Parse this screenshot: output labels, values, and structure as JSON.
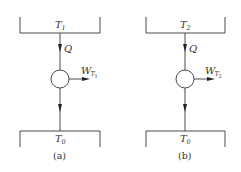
{
  "diagrams": [
    {
      "id": "a",
      "caption": "(a)",
      "hot_reservoir": {
        "symbol": "T",
        "subscript": "1"
      },
      "heat_flow": {
        "label": "Q"
      },
      "work_output": {
        "symbol": "W",
        "subscript": "T",
        "subsubscript": "1"
      },
      "cold_reservoir": {
        "symbol": "T",
        "subscript": "0"
      }
    },
    {
      "id": "b",
      "caption": "(b)",
      "hot_reservoir": {
        "symbol": "T",
        "subscript": "2"
      },
      "heat_flow": {
        "label": "Q"
      },
      "work_output": {
        "symbol": "W",
        "subscript": "T",
        "subsubscript": "2"
      },
      "cold_reservoir": {
        "symbol": "T",
        "subscript": "0"
      }
    }
  ],
  "colors": {
    "line": "#4a4a4a",
    "text": "#333333",
    "background": "#ffffff"
  }
}
